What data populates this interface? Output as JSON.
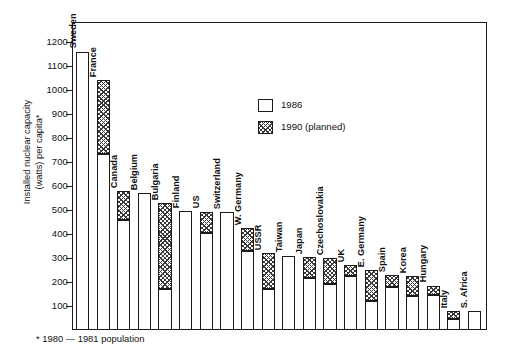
{
  "chart_data": {
    "type": "bar",
    "title": "",
    "subtitle": "",
    "xlabel": "",
    "ylabel": "Installed nuclear capacity\n(watts) per capita*",
    "ylim": [
      0,
      1280
    ],
    "yticks": [
      100,
      200,
      300,
      400,
      500,
      600,
      700,
      800,
      900,
      1000,
      1100,
      1200
    ],
    "ytick_labels": [
      "100",
      "200",
      "300",
      "400",
      "500",
      "600",
      "700",
      "800",
      "900",
      "1000",
      "1100",
      "1200"
    ],
    "grid": false,
    "stacked": "overlay",
    "legend_position": "inside-top-center",
    "footnote": "* 1980 — 1981 population",
    "categories": [
      "Sweden",
      "France",
      "Canada",
      "Belgium",
      "Bulgaria",
      "Finland",
      "US",
      "Switzerland",
      "W. Germany",
      "USSR",
      "Taiwan",
      "Japan",
      "Czechoslovakia",
      "UK",
      "E. Germany",
      "Spain",
      "Korea",
      "Hungary",
      "Italy",
      "S. Africa"
    ],
    "series": [
      {
        "name": "1986",
        "fill": "white",
        "values": [
          1160,
          735,
          460,
          570,
          170,
          495,
          403,
          490,
          330,
          170,
          310,
          215,
          190,
          225,
          120,
          180,
          140,
          145,
          45,
          78
        ]
      },
      {
        "name": "1990 (planned)",
        "fill": "crosshatch",
        "values": [
          1160,
          1040,
          578,
          570,
          530,
          495,
          493,
          490,
          425,
          322,
          310,
          305,
          300,
          272,
          250,
          228,
          225,
          185,
          80,
          78
        ]
      }
    ]
  },
  "legend": {
    "entries": [
      {
        "label": "1986",
        "swatch": "plain-square-icon"
      },
      {
        "label": "1990 (planned)",
        "swatch": "crosshatch-square-icon"
      }
    ]
  },
  "axis": {
    "y_title": "Installed nuclear capacity\n(watts) per capita*"
  },
  "footnote": {
    "text": "* 1980 — 1981 population"
  },
  "colors": {
    "ink": "#1b1b1b",
    "background": "#ffffff",
    "hatch": "#3a3a3a"
  }
}
